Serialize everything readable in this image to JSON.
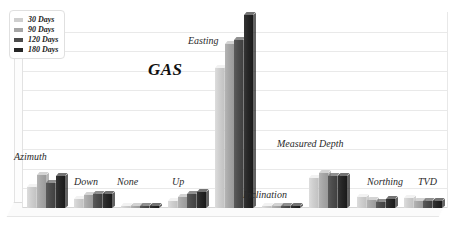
{
  "chart_data": {
    "type": "bar",
    "title": "GAS",
    "xlabel": "",
    "ylabel": "",
    "ylim": [
      0,
      10
    ],
    "grid": true,
    "gridlines": 9,
    "legend_position": "top-left",
    "categories": [
      "Azimuth",
      "Down",
      "None",
      "Up",
      "Easting",
      "Inclination",
      "Measured Depth",
      "Northing",
      "TVD"
    ],
    "series": [
      {
        "name": "30 Days",
        "color": "#cfcfcf",
        "values": [
          1.05,
          0.45,
          0.06,
          0.35,
          7.15,
          0.1,
          1.55,
          0.55,
          0.5
        ]
      },
      {
        "name": "90 Days",
        "color": "#a6a6a6",
        "values": [
          1.7,
          0.65,
          0.06,
          0.55,
          8.35,
          0.1,
          1.8,
          0.4,
          0.35
        ]
      },
      {
        "name": "120 Days",
        "color": "#4d4d4d",
        "values": [
          1.3,
          0.7,
          0.08,
          0.72,
          8.55,
          0.12,
          1.65,
          0.3,
          0.35
        ]
      },
      {
        "name": "180 Days",
        "color": "#262626",
        "values": [
          1.62,
          0.72,
          0.08,
          0.8,
          9.85,
          0.12,
          1.62,
          0.45,
          0.35
        ]
      }
    ],
    "category_label_offsets": [
      {
        "label": "Azimuth",
        "left": 14,
        "top": 151
      },
      {
        "label": "Down",
        "left": 74,
        "top": 176
      },
      {
        "label": "None",
        "left": 117,
        "top": 176
      },
      {
        "label": "Up",
        "left": 172,
        "top": 176
      },
      {
        "label": "Easting",
        "left": 188,
        "top": 35
      },
      {
        "label": "Inclination",
        "left": 243,
        "top": 189
      },
      {
        "label": "Measured Depth",
        "left": 277,
        "top": 138
      },
      {
        "label": "Northing",
        "left": 367,
        "top": 176
      },
      {
        "label": "TVD",
        "left": 418,
        "top": 176
      }
    ],
    "title_position": {
      "left": 148,
      "top": 60
    }
  },
  "legend": {
    "items": [
      {
        "label": "30 Days",
        "color": "#cfcfcf"
      },
      {
        "label": "90 Days",
        "color": "#a6a6a6"
      },
      {
        "label": "120 Days",
        "color": "#4d4d4d"
      },
      {
        "label": "180 Days",
        "color": "#262626"
      }
    ]
  }
}
